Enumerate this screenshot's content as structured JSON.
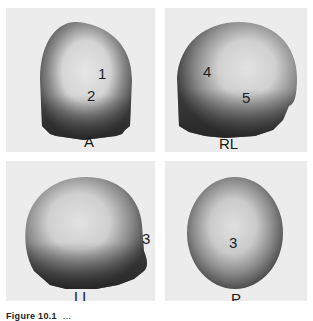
{
  "figure": {
    "panels": [
      {
        "view": "A",
        "markers": [
          "1",
          "2"
        ]
      },
      {
        "view": "RL",
        "markers": [
          "4",
          "5"
        ]
      },
      {
        "view": "LL",
        "markers": [
          "3"
        ]
      },
      {
        "view": "P",
        "markers": [
          "3"
        ]
      }
    ],
    "caption": {
      "label": "Figure 10.1",
      "text": "..."
    },
    "colors": {
      "panel_bg": "#ececec",
      "activity_dark": "#3a3a3a",
      "activity_light": "#d8d8d8"
    }
  }
}
